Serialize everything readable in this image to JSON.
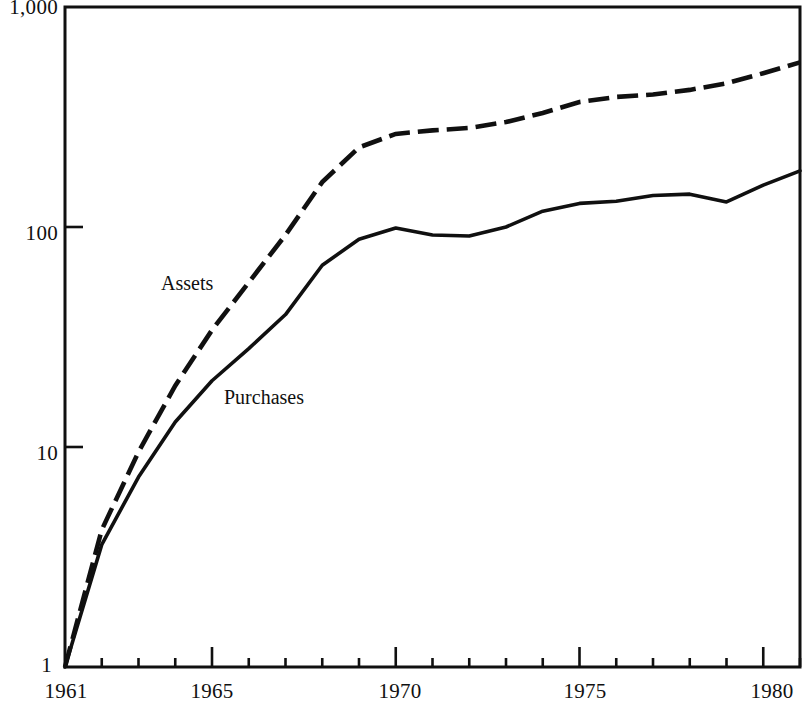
{
  "chart_data": {
    "type": "line",
    "title": "",
    "subtitle": "",
    "xlabel": "",
    "ylabel": "",
    "yscale": "log",
    "ylim": [
      1,
      1000
    ],
    "xlim": [
      1961,
      1981
    ],
    "grid": false,
    "legend_position": "inline-annotation",
    "y_tick_labels": [
      "1,000",
      "100",
      "10",
      "1"
    ],
    "y_tick_values": [
      1000,
      100,
      10,
      1
    ],
    "x_tick_labels": [
      "1961",
      "1965",
      "1970",
      "1975",
      "1980"
    ],
    "x_major_tick_values": [
      1961,
      1965,
      1970,
      1975,
      1980
    ],
    "x_minor_tick_values": [
      1962,
      1963,
      1964,
      1966,
      1967,
      1968,
      1969,
      1971,
      1972,
      1973,
      1974,
      1976,
      1977,
      1978,
      1979,
      1981
    ],
    "x": [
      1961,
      1962,
      1963,
      1964,
      1965,
      1966,
      1967,
      1968,
      1969,
      1970,
      1971,
      1972,
      1973,
      1974,
      1975,
      1976,
      1977,
      1978,
      1979,
      1980,
      1981
    ],
    "series": [
      {
        "name": "Assets",
        "style": "dashed",
        "color": "#101010",
        "values": [
          1,
          4.2,
          9.5,
          19,
          34,
          56,
          92,
          160,
          230,
          265,
          275,
          282,
          300,
          330,
          370,
          390,
          400,
          420,
          450,
          500,
          560
        ]
      },
      {
        "name": "Purchases",
        "style": "solid",
        "color": "#101010",
        "values": [
          1,
          3.6,
          7.3,
          13,
          20,
          28,
          40,
          67,
          88,
          99,
          92,
          91,
          100,
          118,
          128,
          131,
          139,
          141,
          130,
          155,
          180
        ]
      }
    ],
    "annotations": [
      {
        "name": "assets-label",
        "text": "Assets",
        "x_px": 161,
        "y_px": 272
      },
      {
        "name": "purchases-label",
        "text": "Purchases",
        "x_px": 224,
        "y_px": 386
      }
    ]
  }
}
